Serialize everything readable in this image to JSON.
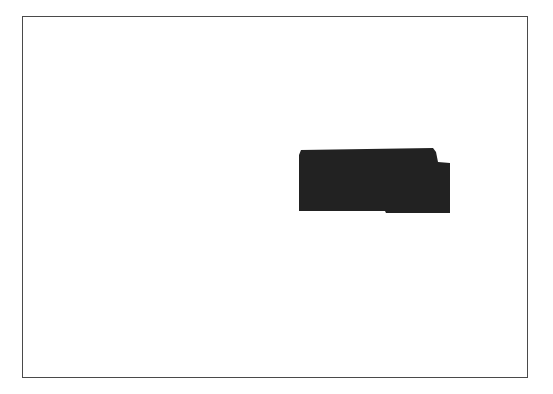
{
  "figure": {
    "frame": {
      "border_color": "#4a4a4a",
      "background": "#ffffff"
    },
    "region": {
      "label": "",
      "fill_color": "#222222"
    }
  }
}
